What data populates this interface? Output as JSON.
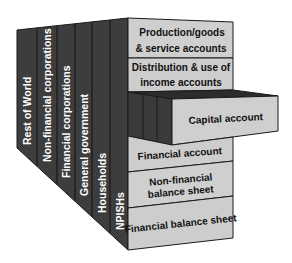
{
  "diagram": {
    "type": "3d-block-matrix",
    "colors": {
      "dark_face": "#3c3c3c",
      "dark_face_alt": "#454545",
      "light_face": "#cfcfcf",
      "outline": "#1a1a1a",
      "sector_text": "#ffffff",
      "account_text": "#111111"
    },
    "sectors": [
      {
        "label": "Rest of World"
      },
      {
        "label": "Non-financial corporations"
      },
      {
        "label": "Financial corporations"
      },
      {
        "label": "General government"
      },
      {
        "label": "Households"
      },
      {
        "label": "NPISHs"
      }
    ],
    "accounts": [
      {
        "line1": "Production/goods",
        "line2": "& service accounts"
      },
      {
        "line1": "Distribution & use of",
        "line2": "income accounts"
      },
      {
        "line1": "Capital account",
        "line2": "",
        "protruding": true
      },
      {
        "line1": "Financial account",
        "line2": ""
      },
      {
        "line1": "Non-financial",
        "line2": "balance sheet"
      },
      {
        "line1": "Financial balance sheet",
        "line2": ""
      }
    ]
  }
}
